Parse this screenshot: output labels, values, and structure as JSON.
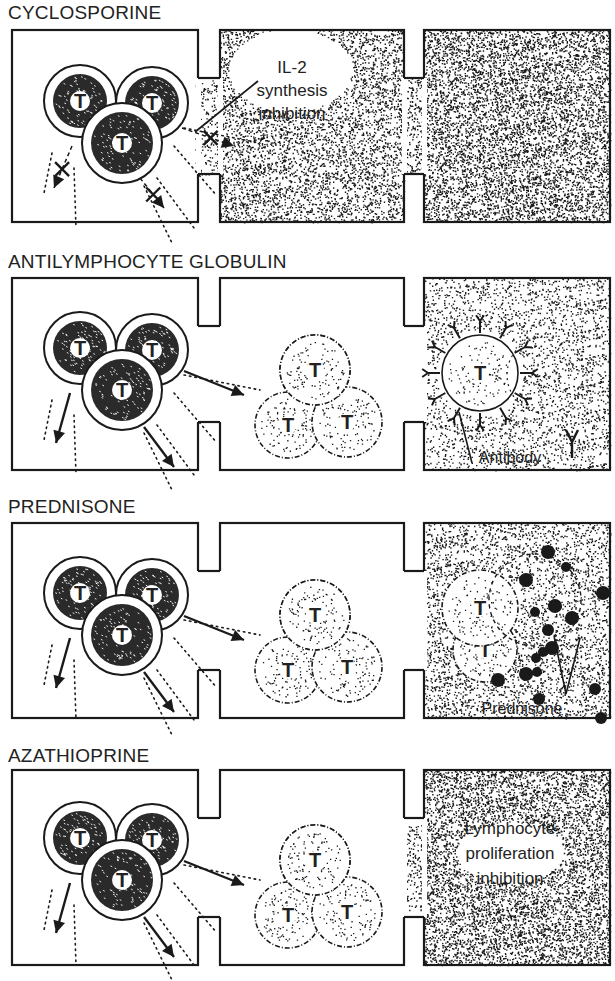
{
  "figure": {
    "colors": {
      "ink": "#1a1a1a",
      "paper": "#ffffff"
    }
  },
  "rows": [
    {
      "title": "CYCLOSPORINE",
      "label_lines": [
        "IL-2",
        "synthesis",
        "inhibition"
      ],
      "cell_marker": "T",
      "panel3": "stippled"
    },
    {
      "title": "ANTILYMPHOCYTE GLOBULIN",
      "label_lines": [
        "Antibody"
      ],
      "cell_marker": "T",
      "panel3": "antibody"
    },
    {
      "title": "PREDNISONE",
      "label_lines": [
        "Prednisone"
      ],
      "cell_marker": "T",
      "panel3": "prednisone"
    },
    {
      "title": "AZATHIOPRINE",
      "label_lines": [
        "Lymphocyte",
        "proliferation",
        "inhibition"
      ],
      "cell_marker": "T",
      "panel3": "stippled"
    }
  ]
}
